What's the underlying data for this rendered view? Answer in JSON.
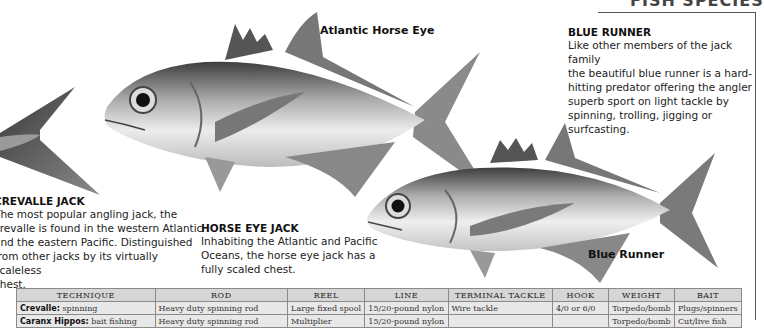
{
  "header": {
    "cropped_title": "FISH SPECIES"
  },
  "fish_labels": {
    "atlantic_horse_eye": "Atlantic Horse Eye",
    "blue_runner": "Blue Runner"
  },
  "descriptions": {
    "blue_runner": {
      "title": "BLUE RUNNER",
      "lines": [
        "Like other members of the jack family",
        "the beautiful blue runner is a hard-",
        "hitting predator offering the angler",
        "superb sport on light tackle by",
        "spinning, trolling, jigging or",
        "surfcasting."
      ]
    },
    "crevalle_jack": {
      "title": "CREVALLE JACK",
      "lines": [
        "The most popular angling jack, the",
        "crevalle is found in the western Atlantic",
        "and the eastern Pacific. Distinguished",
        "from other jacks by its virtually scaleless",
        "chest."
      ]
    },
    "horse_eye_jack": {
      "title": "HORSE EYE JACK",
      "lines": [
        "Inhabiting the Atlantic and Pacific",
        "Oceans, the horse eye jack has a",
        "fully scaled chest."
      ]
    }
  },
  "tackle_table": {
    "headers": [
      "TECHNIQUE",
      "ROD",
      "REEL",
      "LINE",
      "TERMINAL TACKLE",
      "HOOK",
      "WEIGHT",
      "BAIT"
    ],
    "rows": [
      {
        "technique_label": "Crevalle:",
        "technique_value": "spinning",
        "rod": "Heavy duty spinning rod",
        "reel": "Large fixed spool",
        "line": "15/20-pound nylon",
        "terminal_tackle": "Wire tackle",
        "hook": "4/0 or 6/0",
        "weight": "Torpedo/bomb",
        "bait": "Plugs/spinners"
      },
      {
        "technique_label": "Caranx Hippos:",
        "technique_value": "bait fishing",
        "rod": "Heavy duty spinning rod",
        "reel": "Multiplier",
        "line": "15/20-pound nylon",
        "terminal_tackle": "",
        "hook": "",
        "weight": "Torpedo/bomb",
        "bait": "Cut/live fish"
      }
    ]
  }
}
